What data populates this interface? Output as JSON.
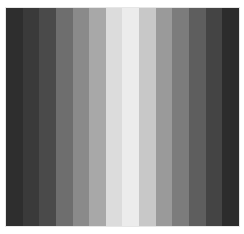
{
  "image": {
    "description": "Grayscale vertical stripe gradient, dark at edges, brightest near center",
    "stripe_count": 14,
    "stripes": [
      {
        "index": 0,
        "color": "#2e2e2e"
      },
      {
        "index": 1,
        "color": "#3a3a3a"
      },
      {
        "index": 2,
        "color": "#4a4a4a"
      },
      {
        "index": 3,
        "color": "#6e6e6e"
      },
      {
        "index": 4,
        "color": "#8a8a8a"
      },
      {
        "index": 5,
        "color": "#a8a8a8"
      },
      {
        "index": 6,
        "color": "#dcdcdc"
      },
      {
        "index": 7,
        "color": "#ececec"
      },
      {
        "index": 8,
        "color": "#c8c8c8"
      },
      {
        "index": 9,
        "color": "#9a9a9a"
      },
      {
        "index": 10,
        "color": "#7c7c7c"
      },
      {
        "index": 11,
        "color": "#5e5e5e"
      },
      {
        "index": 12,
        "color": "#444444"
      },
      {
        "index": 13,
        "color": "#2c2c2c"
      }
    ],
    "background": "#ffffff"
  }
}
